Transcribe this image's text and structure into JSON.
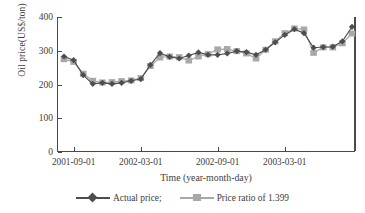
{
  "chart_data": {
    "type": "line",
    "title": "",
    "xlabel": "Time (year-month-day)",
    "ylabel": "Oil price(US$/ton)",
    "ylim": [
      0,
      400
    ],
    "yticks": [
      0,
      100,
      200,
      300,
      400
    ],
    "xtick_labels": [
      "2001-09-01",
      "2002-03-01",
      "2002-09-01",
      "2003-03-01"
    ],
    "xtick_indices": [
      1,
      8,
      16,
      23
    ],
    "grid": false,
    "legend_position": "bottom",
    "n_points": 31,
    "series": [
      {
        "name": "Actual price;",
        "color": "#4d4d4d",
        "marker": "diamond",
        "values": [
          283,
          272,
          228,
          202,
          205,
          202,
          205,
          211,
          216,
          258,
          293,
          282,
          277,
          286,
          295,
          288,
          288,
          292,
          299,
          296,
          288,
          303,
          325,
          347,
          364,
          352,
          309,
          311,
          312,
          328,
          371
        ]
      },
      {
        "name": "Price ratio of 1.399",
        "color": "#a8a8a8",
        "marker": "square",
        "values": [
          275,
          267,
          232,
          211,
          206,
          207,
          210,
          212,
          219,
          255,
          280,
          283,
          281,
          271,
          283,
          290,
          304,
          305,
          299,
          292,
          277,
          303,
          328,
          352,
          366,
          363,
          294,
          310,
          310,
          322,
          351
        ]
      }
    ]
  },
  "legend": {
    "items": [
      {
        "label": "Actual price;"
      },
      {
        "label": "Price ratio of 1.399"
      }
    ]
  },
  "axis": {
    "y_title": "Oil price(US$/ton)",
    "x_title": "Time (year-month-day)"
  }
}
